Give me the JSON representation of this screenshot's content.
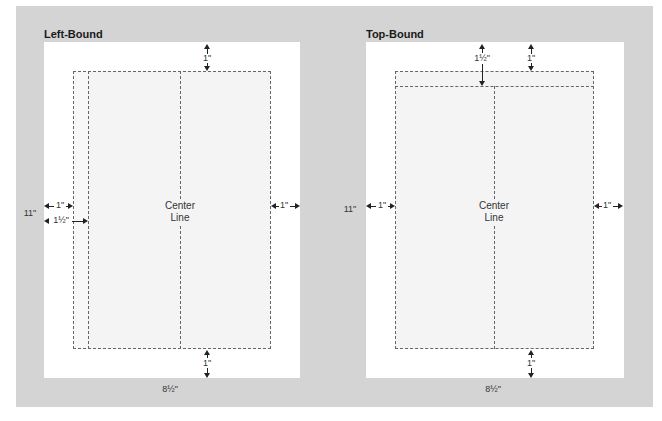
{
  "diagrams": [
    {
      "title": "Left-Bound",
      "center_label_line1": "Center",
      "center_label_line2": "Line",
      "top_margin": "1\"",
      "bottom_margin": "1\"",
      "left_margin": "1\"",
      "binding_margin": "1½\"",
      "right_margin": "1\"",
      "height_label": "11\"",
      "width_label": "8½\""
    },
    {
      "title": "Top-Bound",
      "center_label_line1": "Center",
      "center_label_line2": "Line",
      "top_margin": "1\"",
      "binding_margin": "1½\"",
      "bottom_margin": "1\"",
      "left_margin": "1\"",
      "right_margin": "1\"",
      "height_label": "11\"",
      "width_label": "8½\""
    }
  ],
  "colors": {
    "background": "#d4d4d4",
    "page": "#ffffff",
    "text_area": "#f4f4f4",
    "dashes": "#666666"
  }
}
